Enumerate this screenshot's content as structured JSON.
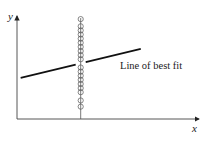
{
  "chart_data": {
    "type": "scatter",
    "title": "",
    "xlabel": "x",
    "ylabel": "y",
    "xlim": [
      0,
      1
    ],
    "ylim": [
      0,
      1
    ],
    "grid": false,
    "legend": null,
    "note": "Schematic figure with unlabeled axes; values are on a normalized 0-1 scale estimated from the drawing.",
    "series": [
      {
        "name": "data points",
        "marker": "open-circle",
        "points": [
          {
            "x": 0.35,
            "y": 0.97
          },
          {
            "x": 0.35,
            "y": 0.9
          },
          {
            "x": 0.35,
            "y": 0.86
          },
          {
            "x": 0.35,
            "y": 0.82
          },
          {
            "x": 0.35,
            "y": 0.78
          },
          {
            "x": 0.35,
            "y": 0.74
          },
          {
            "x": 0.35,
            "y": 0.7
          },
          {
            "x": 0.35,
            "y": 0.66
          },
          {
            "x": 0.35,
            "y": 0.62
          },
          {
            "x": 0.35,
            "y": 0.58
          },
          {
            "x": 0.35,
            "y": 0.5
          },
          {
            "x": 0.35,
            "y": 0.46
          },
          {
            "x": 0.35,
            "y": 0.42
          },
          {
            "x": 0.35,
            "y": 0.38
          },
          {
            "x": 0.35,
            "y": 0.34
          },
          {
            "x": 0.35,
            "y": 0.3
          },
          {
            "x": 0.35,
            "y": 0.26
          },
          {
            "x": 0.35,
            "y": 0.18
          },
          {
            "x": 0.35,
            "y": 0.12
          }
        ]
      }
    ],
    "vertical_line": {
      "x": 0.35,
      "y_range": [
        0,
        0.98
      ]
    },
    "best_fit_line": {
      "label": "Line of best fit",
      "x_range": [
        0.02,
        0.68
      ],
      "y_at_start": 0.4,
      "y_at_end": 0.68
    }
  }
}
